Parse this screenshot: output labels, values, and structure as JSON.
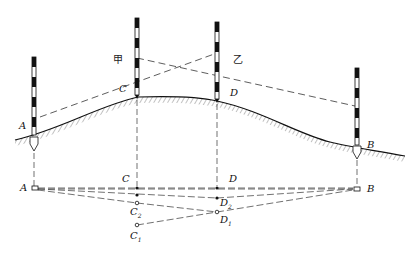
{
  "figure": {
    "title": "",
    "profile_labels": {
      "A": "A",
      "B": "B",
      "C": "C",
      "D": "D",
      "sight_jia": "甲",
      "sight_yi": "乙"
    },
    "plan_labels": {
      "A": "A",
      "B": "B",
      "C": "C",
      "D": "D",
      "C1": "C",
      "C1_sub": "1",
      "C2": "C",
      "C2_sub": "2",
      "D1": "D",
      "D1_sub": "1",
      "D2": "D",
      "D2_sub": "2"
    },
    "colors": {
      "ink": "#111111",
      "dash": "#333333",
      "hatch": "#555555"
    }
  }
}
